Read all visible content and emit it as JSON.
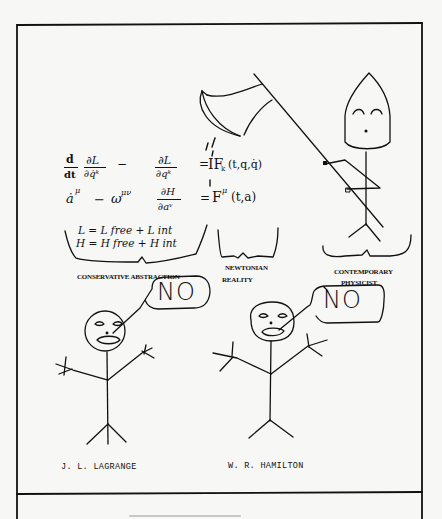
{
  "cartoon": {
    "panel": {
      "border_color": "#111111",
      "background": "#f7f7f5"
    },
    "equations": {
      "lagrange": {
        "lhs": "d/dt ∂L/∂q̇ᵏ − ∂L/∂qᵏ",
        "rhs": "= F_k(t, q, q̇)",
        "d_num": "d",
        "d_den": "dt",
        "f1_num": "∂L",
        "f1_den": "∂q̇ᵏ",
        "minus": "−",
        "f2_num": "∂L",
        "f2_den": "∂qᵏ",
        "eq": "=",
        "force": "IF",
        "force_sub": "k",
        "force_args": "(t,q,q̇)"
      },
      "hamilton": {
        "adot": "ȧ",
        "adot_sup": "μ",
        "minus": "−",
        "omega": "ω",
        "omega_sup": "μν",
        "f_num": "∂H",
        "f_den": "∂aᵛ",
        "eq": "=",
        "force": "F",
        "force_sup": "μ",
        "force_args": "(t,a)"
      },
      "split": {
        "L_line": "L = L free + L int",
        "H_line": "H = H free + H int"
      }
    },
    "labels": {
      "conservative": "CONSERVATIVE ABSTRACTION",
      "newtonian_1": "NEWTONIAN",
      "newtonian_2": "REALITY",
      "physicist_1": "CONTEMPORARY",
      "physicist_2": "PHYSICIST"
    },
    "figures": {
      "left": {
        "speech": "NO",
        "name": "J. L. LAGRANGE"
      },
      "right": {
        "speech": "NO",
        "name": "W. R. HAMILTON"
      }
    },
    "props": {
      "axe_icon": "axe"
    }
  }
}
